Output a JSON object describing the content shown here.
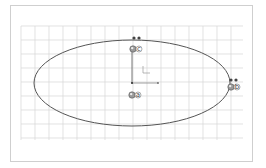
{
  "sketch": {
    "grid": {
      "x0": 21,
      "y0": 26,
      "x1": 243,
      "y1": 140,
      "step": 14,
      "color": "#d6d6d6"
    },
    "ellipse": {
      "cx": 132,
      "cy": 83,
      "rx": 98,
      "ry": 43,
      "stroke": "#555555"
    },
    "origin": {
      "x": 132,
      "y": 83
    },
    "points": [
      {
        "id": "a",
        "label": "a",
        "x": 132,
        "y": 95
      },
      {
        "id": "b",
        "label": "b",
        "x": 231,
        "y": 87
      },
      {
        "id": "c",
        "label": "c",
        "x": 133,
        "y": 49
      }
    ],
    "constraint_markers": [
      {
        "x": 134,
        "y": 38
      },
      {
        "x": 139,
        "y": 38
      },
      {
        "x": 231,
        "y": 80
      },
      {
        "x": 236,
        "y": 80
      }
    ]
  }
}
